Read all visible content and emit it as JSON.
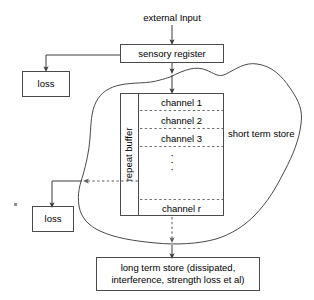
{
  "diagram": {
    "title": "external Input",
    "type": "flow-diagram",
    "stroke_color": "#4a4a4a",
    "dashed_color": "#7d7d7d",
    "background": "#ffffff"
  },
  "nodes": {
    "external_input": "external Input",
    "sensory_register": "sensory register",
    "loss_top": "loss",
    "loss_bottom": "loss",
    "long_term_store": "long term store (dissipated, interference, strength loss et al)",
    "long_term_store_line1": "long term store (dissipated,",
    "long_term_store_line2": "interference, strength loss et al)",
    "short_term_store": "short term store",
    "repeat_buffer": "repeat buffer"
  },
  "channels": [
    {
      "label": "channel 1"
    },
    {
      "label": "channel 2"
    },
    {
      "label": "channel 3"
    },
    {
      "label": "channel r"
    }
  ],
  "ellipsis": {
    "dots": [
      "·",
      "·",
      "·"
    ]
  },
  "edges": [
    {
      "from": "external_input",
      "to": "sensory_register",
      "style": "solid"
    },
    {
      "from": "sensory_register",
      "to": "loss_top",
      "style": "solid"
    },
    {
      "from": "sensory_register",
      "to": "short_term_store",
      "style": "solid"
    },
    {
      "from": "repeat_buffer",
      "to": "loss_bottom",
      "style": "dashed"
    },
    {
      "from": "channel_r",
      "to": "long_term_store",
      "style": "dashed"
    }
  ]
}
